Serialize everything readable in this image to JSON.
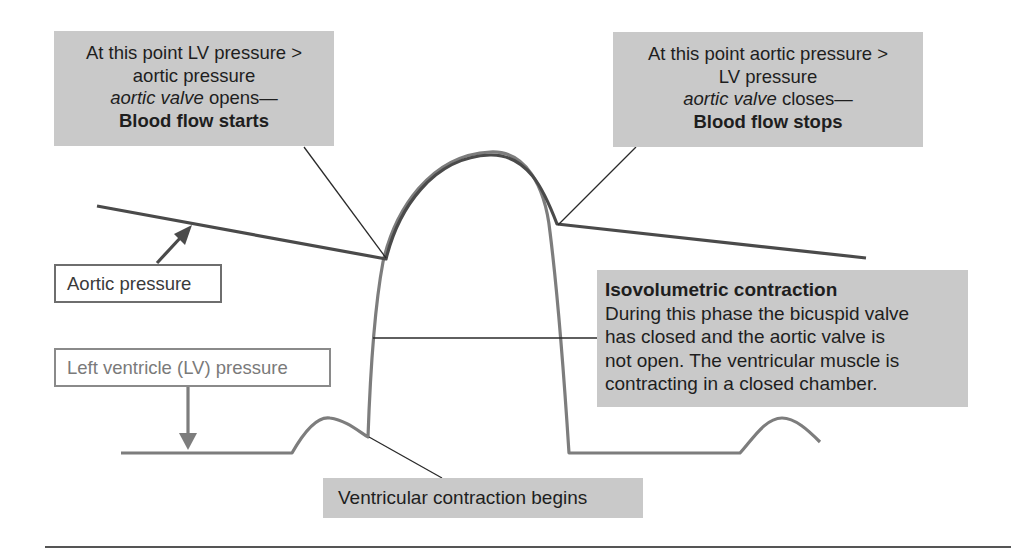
{
  "diagram": {
    "colors": {
      "callout_fill": "#c9c9c9",
      "aortic_curve": "#4a4a4a",
      "lv_curve": "#7d7d7d",
      "leader_line": "#2a2a2a",
      "text": "#1e1e1e"
    },
    "callouts": {
      "valve_opens": {
        "line1": "At this point LV pressure >",
        "line2": "aortic pressure",
        "line3_italic": "aortic valve",
        "line3_rest": " opens—",
        "line4_bold": "Blood flow starts"
      },
      "valve_closes": {
        "line1": "At this point aortic pressure >",
        "line2": "LV pressure",
        "line3_italic": "aortic valve",
        "line3_rest": " closes—",
        "line4_bold": "Blood flow stops"
      },
      "isovolumetric": {
        "heading": "Isovolumetric contraction",
        "line1": "During this phase the bicuspid valve",
        "line2": "has closed and the aortic valve is",
        "line3": "not open. The ventricular muscle is",
        "line4": "contracting in a closed chamber."
      },
      "contraction_begins": {
        "label": "Ventricular contraction begins"
      }
    },
    "legend": {
      "aortic_pressure": "Aortic pressure",
      "lv_pressure": "Left ventricle (LV) pressure"
    },
    "icons": {
      "aortic_arrow": "arrow-up-right-icon",
      "lv_arrow": "arrow-down-icon"
    }
  }
}
